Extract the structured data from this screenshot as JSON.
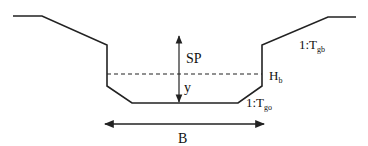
{
  "diagram": {
    "type": "trapezoidal channel cross-section",
    "colors": {
      "line": "#222222",
      "background": "#ffffff"
    },
    "labels": {
      "freeboard": "SP",
      "depth": "y",
      "bankfull_height_main": "H",
      "bankfull_height_sub": "b",
      "bank_slope_main": "1:T",
      "bank_slope_sub": "gb",
      "bottom_slope_main": "1:T",
      "bottom_slope_sub": "go",
      "width": "B"
    },
    "elements": {
      "water_level_line": "dashed",
      "vertical_arrow": "double-headed (SP + y)",
      "width_arrow": "double-headed (B)"
    }
  }
}
